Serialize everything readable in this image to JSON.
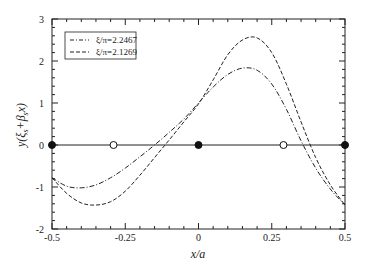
{
  "chart_data": {
    "type": "line",
    "title": "",
    "xlabel": "x/a",
    "ylabel": "y(ξs+βsx)",
    "xlim": [
      -0.5,
      0.5
    ],
    "ylim": [
      -2,
      3
    ],
    "x_ticks": [
      -0.5,
      -0.25,
      0,
      0.25,
      0.5
    ],
    "x_tick_labels": [
      "-0.5",
      "-0.25",
      "0",
      "0.25",
      "0.5"
    ],
    "y_ticks": [
      -2,
      -1,
      0,
      1,
      2,
      3
    ],
    "y_tick_labels": [
      "-2",
      "-1",
      "0",
      "1",
      "2",
      "3"
    ],
    "grid": false,
    "legend_position": "upper left",
    "x": [
      -0.5,
      -0.45,
      -0.4,
      -0.35,
      -0.3,
      -0.25,
      -0.2,
      -0.15,
      -0.1,
      -0.05,
      0,
      0.05,
      0.1,
      0.15,
      0.2,
      0.25,
      0.3,
      0.35,
      0.4,
      0.45,
      0.5
    ],
    "series": [
      {
        "name": "ξ/π=2.2467",
        "style": "dash-dot",
        "values": [
          -0.78,
          -0.98,
          -1.02,
          -0.95,
          -0.78,
          -0.55,
          -0.28,
          0.0,
          0.3,
          0.62,
          1.0,
          1.38,
          1.68,
          1.83,
          1.78,
          1.45,
          0.85,
          0.1,
          -0.55,
          -1.05,
          -1.43
        ]
      },
      {
        "name": "ξ/π=2.1269",
        "style": "dashed",
        "values": [
          -0.78,
          -1.15,
          -1.38,
          -1.43,
          -1.35,
          -1.1,
          -0.72,
          -0.3,
          0.12,
          0.55,
          0.98,
          1.55,
          2.15,
          2.5,
          2.55,
          2.2,
          1.45,
          0.55,
          -0.3,
          -0.95,
          -1.43
        ]
      }
    ],
    "reference_line": {
      "y": 0,
      "style": "solid"
    },
    "markers": [
      {
        "x": -0.5,
        "y": 0,
        "fill": "filled"
      },
      {
        "x": -0.29,
        "y": 0,
        "fill": "open"
      },
      {
        "x": 0,
        "y": 0,
        "fill": "filled"
      },
      {
        "x": 0.29,
        "y": 0,
        "fill": "open"
      },
      {
        "x": 0.5,
        "y": 0,
        "fill": "filled"
      }
    ],
    "colors": {
      "line": "#222222",
      "axis": "#222222",
      "background": "#ffffff"
    }
  }
}
